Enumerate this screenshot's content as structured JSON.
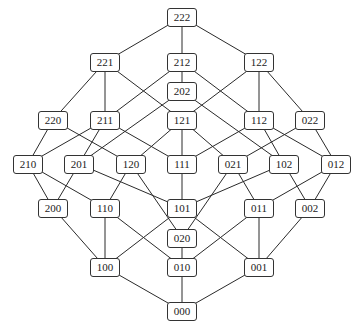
{
  "diagram": {
    "type": "hasse-diagram",
    "nodes": [
      {
        "id": "222",
        "label": "222",
        "x": 182,
        "y": 17
      },
      {
        "id": "221",
        "label": "221",
        "x": 105,
        "y": 62
      },
      {
        "id": "212",
        "label": "212",
        "x": 182,
        "y": 62
      },
      {
        "id": "122",
        "label": "122",
        "x": 259,
        "y": 62
      },
      {
        "id": "202",
        "label": "202",
        "x": 182,
        "y": 91
      },
      {
        "id": "220",
        "label": "220",
        "x": 53,
        "y": 120
      },
      {
        "id": "211",
        "label": "211",
        "x": 105,
        "y": 120
      },
      {
        "id": "121",
        "label": "121",
        "x": 182,
        "y": 120
      },
      {
        "id": "112",
        "label": "112",
        "x": 259,
        "y": 120
      },
      {
        "id": "022",
        "label": "022",
        "x": 310,
        "y": 120
      },
      {
        "id": "210",
        "label": "210",
        "x": 28,
        "y": 164
      },
      {
        "id": "201",
        "label": "201",
        "x": 79,
        "y": 164
      },
      {
        "id": "120",
        "label": "120",
        "x": 131,
        "y": 164
      },
      {
        "id": "111",
        "label": "111",
        "x": 182,
        "y": 164
      },
      {
        "id": "021",
        "label": "021",
        "x": 233,
        "y": 164
      },
      {
        "id": "102",
        "label": "102",
        "x": 284,
        "y": 164
      },
      {
        "id": "012",
        "label": "012",
        "x": 336,
        "y": 164
      },
      {
        "id": "200",
        "label": "200",
        "x": 53,
        "y": 208
      },
      {
        "id": "110",
        "label": "110",
        "x": 105,
        "y": 208
      },
      {
        "id": "101",
        "label": "101",
        "x": 182,
        "y": 208
      },
      {
        "id": "011",
        "label": "011",
        "x": 259,
        "y": 208
      },
      {
        "id": "002",
        "label": "002",
        "x": 310,
        "y": 208
      },
      {
        "id": "020",
        "label": "020",
        "x": 182,
        "y": 238
      },
      {
        "id": "100",
        "label": "100",
        "x": 105,
        "y": 267
      },
      {
        "id": "010",
        "label": "010",
        "x": 182,
        "y": 267
      },
      {
        "id": "001",
        "label": "001",
        "x": 259,
        "y": 267
      },
      {
        "id": "000",
        "label": "000",
        "x": 182,
        "y": 311
      }
    ],
    "edges": [
      [
        "222",
        "221"
      ],
      [
        "222",
        "212"
      ],
      [
        "222",
        "122"
      ],
      [
        "221",
        "220"
      ],
      [
        "221",
        "211"
      ],
      [
        "221",
        "121"
      ],
      [
        "212",
        "211"
      ],
      [
        "212",
        "202"
      ],
      [
        "212",
        "112"
      ],
      [
        "122",
        "121"
      ],
      [
        "122",
        "112"
      ],
      [
        "122",
        "022"
      ],
      [
        "202",
        "201"
      ],
      [
        "202",
        "102"
      ],
      [
        "220",
        "210"
      ],
      [
        "220",
        "120"
      ],
      [
        "211",
        "210"
      ],
      [
        "211",
        "201"
      ],
      [
        "211",
        "111"
      ],
      [
        "121",
        "120"
      ],
      [
        "121",
        "111"
      ],
      [
        "121",
        "021"
      ],
      [
        "112",
        "111"
      ],
      [
        "112",
        "102"
      ],
      [
        "112",
        "012"
      ],
      [
        "022",
        "021"
      ],
      [
        "022",
        "012"
      ],
      [
        "210",
        "200"
      ],
      [
        "210",
        "110"
      ],
      [
        "201",
        "200"
      ],
      [
        "201",
        "101"
      ],
      [
        "120",
        "110"
      ],
      [
        "120",
        "020"
      ],
      [
        "111",
        "101"
      ],
      [
        "021",
        "020"
      ],
      [
        "021",
        "011"
      ],
      [
        "102",
        "101"
      ],
      [
        "102",
        "002"
      ],
      [
        "012",
        "011"
      ],
      [
        "012",
        "002"
      ],
      [
        "200",
        "100"
      ],
      [
        "110",
        "100"
      ],
      [
        "110",
        "010"
      ],
      [
        "101",
        "100"
      ],
      [
        "101",
        "001"
      ],
      [
        "020",
        "010"
      ],
      [
        "011",
        "010"
      ],
      [
        "011",
        "001"
      ],
      [
        "002",
        "001"
      ],
      [
        "100",
        "000"
      ],
      [
        "010",
        "000"
      ],
      [
        "001",
        "000"
      ]
    ],
    "colors": {
      "background": "#ffffff",
      "edge": "#2a2a2a",
      "node_border": "#333333",
      "node_fill": "#ffffff",
      "text": "#222222"
    }
  }
}
